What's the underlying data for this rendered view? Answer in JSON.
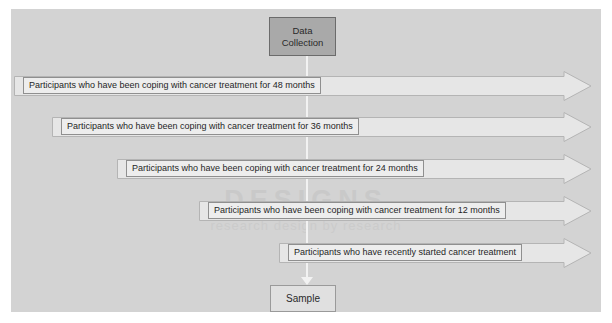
{
  "diagram": {
    "title_node": {
      "line1": "Data",
      "line2": "Collection"
    },
    "bottom_node": {
      "label": "Sample"
    },
    "watermark": {
      "text": "DESIGNS",
      "subtext": "research design by research"
    },
    "colors": {
      "plate_background": "#d3d3d3",
      "top_node_fill": "#a9a9a9",
      "top_node_border": "#6b6b6b",
      "bottom_node_fill": "#e0e0e0",
      "arrow_fill": "#e6e6e6",
      "arrow_border": "#b4b4b4",
      "label_fill": "#ededed",
      "label_border": "#8f8f8f",
      "connector": "#f2f2f2",
      "text": "#1f1f1f"
    },
    "rows": [
      {
        "label": "Participants who have been coping with cancer treatment for 48 months"
      },
      {
        "label": "Participants who have been coping with cancer treatment for 36 months"
      },
      {
        "label": "Participants who have been coping with cancer treatment for 24 months"
      },
      {
        "label": "Participants who have been coping with cancer treatment for 12 months"
      },
      {
        "label": "Participants who have recently started cancer treatment"
      }
    ]
  }
}
